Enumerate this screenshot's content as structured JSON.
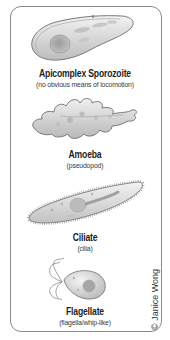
{
  "figure": {
    "organisms": [
      {
        "name": "Apicomplex Sporozoite",
        "locomotion": "(no obvious means of locomotion)",
        "icon": "sporozoite-illustration"
      },
      {
        "name": "Amoeba",
        "locomotion": "(pseudopod)",
        "icon": "amoeba-illustration"
      },
      {
        "name": "Ciliate",
        "locomotion": "(cilia)",
        "icon": "ciliate-illustration"
      },
      {
        "name": "Flagellate",
        "locomotion": "(flagella/whip-like)",
        "icon": "flagellate-illustration"
      }
    ],
    "credit": "© Janice Wong",
    "colors": {
      "frame_border": "#8a8a8a",
      "body_fill": "#d8d8d8",
      "outline": "#7a7a7a",
      "nucleus": "#a8a8a8",
      "text": "#1e1e1e"
    }
  }
}
